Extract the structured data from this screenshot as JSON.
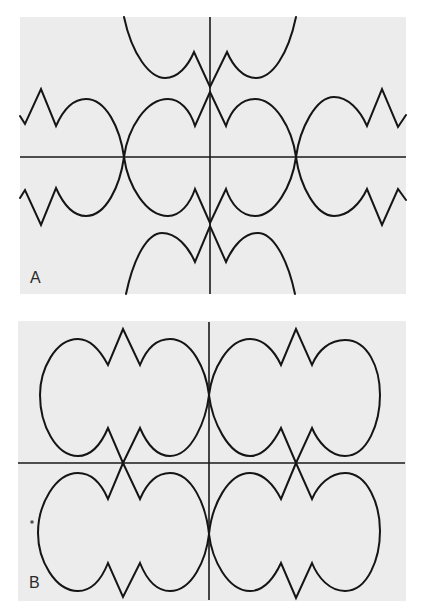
{
  "figure": {
    "width": 425,
    "height": 616,
    "colors": {
      "panel_background": "#ececec",
      "page_background": "#ffffff",
      "line": "#151515"
    }
  },
  "panels": [
    {
      "id": "A",
      "label": "A",
      "label_pos": [
        30,
        283
      ],
      "rect": {
        "x": 20,
        "y": 17,
        "w": 386,
        "h": 277
      },
      "axes": {
        "horizontal": {
          "x1": 20,
          "x2": 406,
          "y": 157
        },
        "vertical": {
          "x": 210,
          "y1": 17,
          "y2": 294
        }
      },
      "curves": [
        {
          "name": "top-branch",
          "d": "M 124 17 C 132 55, 150 78, 165 78 C 178 78, 188 66, 194 52 L 210 87 L 227 52 C 233 66, 243 78, 256 78 C 272 78, 288 55, 296 17"
        },
        {
          "name": "upper-middle-wave",
          "d": "M 20 116 L 25 124 L 41 89 L 56 126 C 64 108, 74 99, 86 99 C 106 99, 120 128, 124 157 C 128 128, 146 99, 168 99 C 180 99, 190 110, 195 126 L 210 92 L 226 126 C 231 110, 241 99, 255 99 C 275 99, 292 128, 296 157 C 300 128, 316 97, 334 97 C 348 97, 360 110, 367 126 L 382 89 L 398 127 L 406 115"
        },
        {
          "name": "lower-middle-wave",
          "d": "M 20 198 L 25 190 L 41 225 L 56 188 C 64 206, 74 216, 86 216 C 106 216, 120 186, 124 157 C 128 186, 146 216, 168 216 C 180 216, 190 204, 195 189 L 210 223 L 226 189 C 231 204, 241 216, 255 216 C 275 216, 292 186, 296 157 C 300 186, 316 216, 334 216 C 348 216, 360 204, 367 189 L 382 225 L 398 189 L 406 200"
        },
        {
          "name": "bottom-branch",
          "d": "M 126 294 C 134 256, 148 233, 162 233 C 176 233, 188 246, 195 262 L 210 226 L 226 262 C 233 246, 244 233, 258 233 C 272 233, 287 256, 295 294"
        }
      ],
      "specks": []
    },
    {
      "id": "B",
      "label": "B",
      "label_pos": [
        29,
        588
      ],
      "rect": {
        "x": 18,
        "y": 321,
        "w": 388,
        "h": 280
      },
      "axes": {
        "horizontal": {
          "x1": 18,
          "x2": 405,
          "y": 463
        },
        "vertical": {
          "x": 209,
          "y1": 322,
          "y2": 600
        }
      },
      "curves": [
        {
          "name": "lobe-upper-left",
          "d": "M 123 329 L 108 365 C 100 350, 90 339, 78 339 C 55 339, 40 370, 40 395 C 40 425, 56 456, 78 456 C 92 456, 102 442, 108 428 L 123 463 L 140 428 C 146 442, 156 456, 170 456 C 192 456, 206 420, 209 395 C 206 370, 192 339, 170 339 C 156 339, 146 350, 140 365 Z"
        },
        {
          "name": "lobe-upper-right",
          "d": "M 296 329 L 281 365 C 274 350, 263 339, 250 339 C 228 339, 212 370, 209 395 C 212 420, 228 456, 250 456 C 264 456, 274 442, 281 428 L 296 463 L 312 428 C 318 442, 330 456, 345 456 C 368 456, 380 422, 380 395 C 380 368, 368 340, 345 340 C 330 340, 318 350, 312 365 Z"
        },
        {
          "name": "lobe-lower-left",
          "d": "M 123 463 L 108 499 C 102 485, 92 473, 78 473 C 55 473, 38 505, 38 533 C 38 560, 55 591, 78 591 C 92 591, 102 578, 108 563 L 123 597 L 140 563 C 146 578, 156 591, 170 591 C 192 591, 206 560, 209 534 C 206 505, 192 473, 170 473 C 156 473, 146 485, 140 499 Z"
        },
        {
          "name": "lobe-lower-right",
          "d": "M 296 463 L 281 499 C 274 485, 263 473, 250 473 C 228 473, 212 505, 209 534 C 212 560, 228 591, 250 591 C 264 591, 274 578, 281 563 L 296 598 L 312 563 C 318 578, 330 591, 345 591 C 368 591, 380 558, 380 531 C 380 505, 368 473, 345 473 C 330 473, 318 485, 312 499 Z"
        }
      ],
      "specks": [
        {
          "cx": 32,
          "cy": 522,
          "r": 1.8
        }
      ]
    }
  ]
}
